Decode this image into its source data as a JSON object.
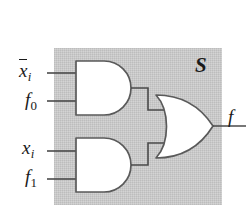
{
  "figure": {
    "module_label": "S",
    "output_label": "f",
    "background_color": "#ffffff",
    "box_fill": "#c9c9c9",
    "gate_fill": "#ffffff",
    "line_color": "#4a4a4a",
    "text_color": "#1a1a1a"
  },
  "inputs": [
    {
      "id": "xbar-i",
      "base": "x",
      "sub": "i",
      "overbar": true,
      "text": "x̄i"
    },
    {
      "id": "f0",
      "base": "f",
      "sub": "0",
      "overbar": false,
      "text": "f0"
    },
    {
      "id": "x-i",
      "base": "x",
      "sub": "i",
      "overbar": false,
      "text": "xi"
    },
    {
      "id": "f1",
      "base": "f",
      "sub": "1",
      "overbar": false,
      "text": "f1"
    }
  ],
  "gates": [
    {
      "id": "and-upper",
      "type": "AND",
      "inputs": [
        "x̄i",
        "f0"
      ]
    },
    {
      "id": "and-lower",
      "type": "AND",
      "inputs": [
        "xi",
        "f1"
      ]
    },
    {
      "id": "or-gate",
      "type": "OR",
      "inputs": [
        "and-upper",
        "and-lower"
      ],
      "output": "f"
    }
  ]
}
